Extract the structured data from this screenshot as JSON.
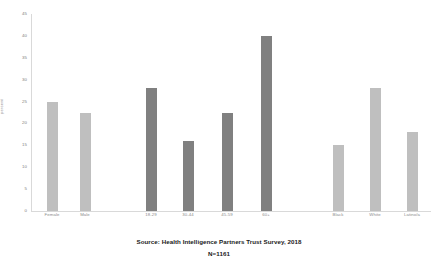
{
  "chart_data": {
    "type": "bar",
    "title": "",
    "xlabel": "",
    "ylabel": "percent",
    "ylim": [
      0,
      45
    ],
    "yticks": [
      0,
      5,
      10,
      15,
      20,
      25,
      30,
      35,
      40,
      45
    ],
    "grid": false,
    "legend": "none",
    "categories": [
      "Female",
      "Male",
      "18-29",
      "30-44",
      "45-59",
      "60+",
      "Black",
      "White",
      "Latino/a"
    ],
    "values": [
      25,
      22.5,
      28,
      16,
      22.5,
      40,
      15,
      28,
      18
    ],
    "groups": [
      {
        "name": "gender",
        "categories": [
          "Female",
          "Male"
        ],
        "values": [
          25,
          22.5
        ],
        "color": "#bfbfbf"
      },
      {
        "name": "age",
        "categories": [
          "18-29",
          "30-44",
          "45-59",
          "60+"
        ],
        "values": [
          28,
          16,
          22.5,
          40
        ],
        "color": "#808080"
      },
      {
        "name": "race-ethnicity",
        "categories": [
          "Black",
          "White",
          "Latino/a"
        ],
        "values": [
          15,
          28,
          18
        ],
        "color": "#bfbfbf"
      }
    ]
  },
  "axis": {
    "y_title": "percent",
    "tick_labels": [
      "45",
      "40",
      "35",
      "30",
      "25",
      "20",
      "15",
      "10",
      "5",
      "0"
    ]
  },
  "caption": {
    "source": "Source: Health Intelligence Partners Trust Survey, 2018",
    "sample": "N=1161"
  },
  "colors": {
    "bar_light": "#bfbfbf",
    "bar_dark": "#808080",
    "axis": "#d9d9d9",
    "tick_text": "#808080",
    "caption_text": "#1a1a1a"
  }
}
